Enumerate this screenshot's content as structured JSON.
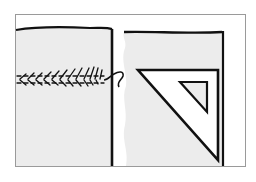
{
  "illustration": {
    "subject": "sewing diagram: basted seam on left fabric, right fabric squared with a set square",
    "colors": {
      "background": "#ffffff",
      "frame": "#9a9a9a",
      "fabric": "#ececec",
      "ink": "#111111",
      "triangle_fill": "#ffffff"
    },
    "elements": [
      {
        "name": "left-fabric-piece"
      },
      {
        "name": "basting-stitches"
      },
      {
        "name": "loose-thread-end"
      },
      {
        "name": "right-fabric-piece"
      },
      {
        "name": "set-square-triangle"
      }
    ]
  }
}
